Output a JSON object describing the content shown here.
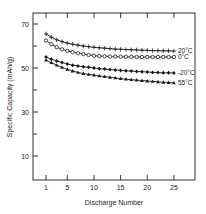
{
  "chart_data": {
    "type": "line",
    "title": "",
    "xlabel": "Discharge Number",
    "ylabel": "Specific Capacity (mAh/g)",
    "xlim": [
      -1,
      30
    ],
    "ylim": [
      0,
      75
    ],
    "x_ticks": [
      1,
      5,
      10,
      15,
      20,
      25
    ],
    "y_ticks": [
      10,
      30,
      50,
      70
    ],
    "y_minor_ticks": [
      20,
      40,
      60
    ],
    "grid": false,
    "legend_position": "inline-right",
    "x": [
      1,
      2,
      3,
      4,
      5,
      6,
      7,
      8,
      9,
      10,
      11,
      12,
      13,
      14,
      15,
      16,
      17,
      18,
      19,
      20,
      21,
      22,
      23,
      24,
      25
    ],
    "series": [
      {
        "name": "20°C",
        "marker": "plus",
        "values": [
          65.5,
          64.0,
          62.8,
          62.0,
          61.3,
          60.8,
          60.4,
          60.0,
          59.7,
          59.4,
          59.2,
          59.0,
          58.8,
          58.6,
          58.5,
          58.4,
          58.3,
          58.2,
          58.1,
          58.0,
          57.9,
          57.9,
          57.8,
          57.8,
          57.7
        ]
      },
      {
        "name": "0°C",
        "marker": "circle-open",
        "values": [
          62.5,
          60.8,
          59.5,
          58.5,
          57.8,
          57.2,
          56.7,
          56.3,
          55.9,
          55.6,
          55.4,
          55.3,
          55.2,
          55.2,
          55.1,
          55.1,
          55.1,
          55.0,
          55.0,
          55.0,
          55.0,
          55.0,
          55.0,
          55.0,
          55.0
        ]
      },
      {
        "name": "-20°C",
        "marker": "diamond-filled",
        "values": [
          55.0,
          54.0,
          53.2,
          52.5,
          51.8,
          51.3,
          50.9,
          50.6,
          50.3,
          50.0,
          49.7,
          49.5,
          49.3,
          49.1,
          48.9,
          48.7,
          48.6,
          48.4,
          48.3,
          48.2,
          48.0,
          47.9,
          47.8,
          47.8,
          47.7
        ]
      },
      {
        "name": "55°C",
        "marker": "triangle-filled",
        "values": [
          53.6,
          52.4,
          51.3,
          50.3,
          49.4,
          48.6,
          48.0,
          47.5,
          47.1,
          46.8,
          46.4,
          46.1,
          45.8,
          45.5,
          45.2,
          44.9,
          44.7,
          44.5,
          44.3,
          44.1,
          43.9,
          43.7,
          43.5,
          43.4,
          43.2
        ]
      }
    ]
  },
  "labels": {
    "xlabel": "Discharge Number",
    "ylabel": "Specific Capacity (mAh/g)",
    "x_ticks": [
      "1",
      "5",
      "10",
      "15",
      "20",
      "25"
    ],
    "y_ticks": [
      "70",
      "50",
      "30",
      "10"
    ],
    "legend": [
      "20°C",
      "0°C",
      "-20°C",
      "55°C"
    ]
  },
  "colors": {
    "line": "#1a1a1a",
    "axis": "#333333",
    "background": "#ffffff"
  }
}
